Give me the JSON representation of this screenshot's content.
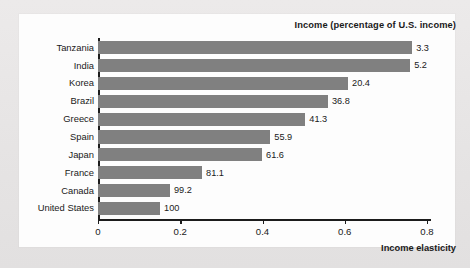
{
  "chart_data": {
    "type": "bar",
    "orientation": "horizontal",
    "title": "Income (percentage of U.S. income)",
    "xlabel": "Income elasticity",
    "ylabel": "",
    "xlim": [
      0,
      0.825
    ],
    "xticks": [
      "0",
      "0.2",
      "0.4",
      "0.6",
      "0.8"
    ],
    "xtick_values": [
      0,
      0.2,
      0.4,
      0.6,
      0.8
    ],
    "grid": false,
    "legend": null,
    "bar_color": "#808080",
    "categories": [
      "Tanzania",
      "India",
      "Korea",
      "Brazil",
      "Greece",
      "Spain",
      "Japan",
      "France",
      "Canada",
      "United States"
    ],
    "values": [
      0.764,
      0.759,
      0.608,
      0.559,
      0.504,
      0.419,
      0.399,
      0.253,
      0.175,
      0.151
    ],
    "data_labels": [
      "3.3",
      "5.2",
      "20.4",
      "36.8",
      "41.3",
      "55.9",
      "61.6",
      "81.1",
      "99.2",
      "100"
    ],
    "data_label_meaning": "Income (percentage of U.S. income)"
  }
}
